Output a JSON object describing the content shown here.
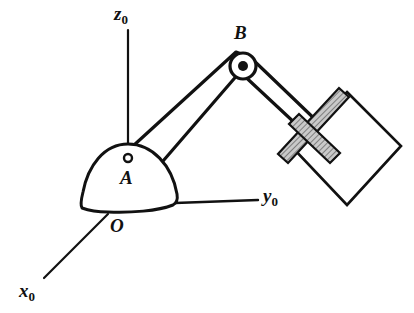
{
  "figure": {
    "background_color": "#ffffff",
    "stroke_color": "#111111",
    "hatch_fill_color": "#b3b3b3"
  },
  "axes": [
    {
      "id": "z0",
      "name": "z-axis",
      "symbol": "z",
      "subscript": "0",
      "label": "z0",
      "line": {
        "x1": 128,
        "y1": 30,
        "x2": 128,
        "y2": 146
      },
      "label_pos": {
        "x": 114,
        "y": 4
      }
    },
    {
      "id": "y0",
      "name": "y-axis",
      "symbol": "y",
      "subscript": "0",
      "label": "y0",
      "line": {
        "x1": 175,
        "y1": 203,
        "x2": 258,
        "y2": 200
      },
      "label_pos": {
        "x": 263,
        "y": 186
      }
    },
    {
      "id": "x0",
      "name": "x-axis",
      "symbol": "x",
      "subscript": "0",
      "label": "x0",
      "line": {
        "x1": 108,
        "y1": 214,
        "x2": 44,
        "y2": 278
      },
      "label_pos": {
        "x": 19,
        "y": 281
      }
    }
  ],
  "points": [
    {
      "id": "O",
      "name": "origin",
      "label": "O",
      "marker": "none",
      "label_pos": {
        "x": 110,
        "y": 216
      }
    },
    {
      "id": "A",
      "name": "shoulder-joint",
      "label": "A",
      "marker": "open-circle",
      "marker_pos": {
        "x": 128,
        "y": 158
      },
      "marker_radius": 4,
      "label_pos": {
        "x": 120,
        "y": 168
      }
    },
    {
      "id": "B",
      "name": "elbow-joint",
      "label": "B",
      "marker": "filled-circle",
      "marker_pos": {
        "x": 243,
        "y": 66
      },
      "marker_radius": 5,
      "label_pos": {
        "x": 234,
        "y": 23
      }
    }
  ],
  "base": {
    "name": "robot-base-dome",
    "path": "M 128 144 C 104 144 88 166 83 192 C 81 200 80 205 82 208 C 90 211 98 212 108 212 C 130 213 158 211 173 205 C 177 203 178 200 177 194 C 172 165 152 144 128 144 Z"
  },
  "links": [
    {
      "name": "upper-arm-link",
      "description": "link from shoulder A to elbow B",
      "path": "M 133 146 L 236 52 L 252 58 L 157 168 Z"
    },
    {
      "name": "forearm-link",
      "description": "link from elbow B to gripper wrist",
      "path": "M 248 55 L 322 126 L 312 139 L 238 70 Z"
    }
  ],
  "gripper": {
    "name": "gripper-assembly",
    "bars": [
      {
        "name": "gripper-bar-long",
        "path": "M 339 88 L 349 97 L 288 163 L 278 154 Z"
      },
      {
        "name": "gripper-bar-cross",
        "path": "M 299 114 L 340 153 L 330 163 L 289 124 Z"
      }
    ]
  },
  "workpiece": {
    "name": "workpiece-square",
    "path": "M 347 92 L 401 146 L 347 205 L 292 147 Z"
  }
}
